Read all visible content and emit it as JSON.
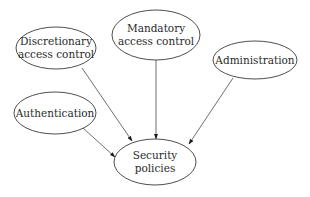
{
  "diagram": {
    "type": "directed-graph",
    "nodes": [
      {
        "id": "discretionary",
        "lines": [
          "Discretionary",
          "access control"
        ],
        "cx": 56,
        "cy": 48,
        "rx": 40,
        "ry": 21
      },
      {
        "id": "mandatory",
        "lines": [
          "Mandatory",
          "access control"
        ],
        "cx": 156,
        "cy": 35,
        "rx": 44,
        "ry": 25
      },
      {
        "id": "administration",
        "lines": [
          "Administration"
        ],
        "cx": 255,
        "cy": 60,
        "rx": 42,
        "ry": 19
      },
      {
        "id": "authentication",
        "lines": [
          "Authentication"
        ],
        "cx": 55,
        "cy": 113,
        "rx": 41,
        "ry": 21
      },
      {
        "id": "security-policies",
        "lines": [
          "Security",
          "policies"
        ],
        "cx": 155,
        "cy": 162,
        "rx": 41,
        "ry": 23
      }
    ],
    "edges": [
      {
        "from": "discretionary",
        "to": "security-policies",
        "x1": 82,
        "y1": 68,
        "x2": 132,
        "y2": 141
      },
      {
        "from": "mandatory",
        "to": "security-policies",
        "x1": 156,
        "y1": 60,
        "x2": 156,
        "y2": 139
      },
      {
        "from": "administration",
        "to": "security-policies",
        "x1": 233,
        "y1": 78,
        "x2": 189,
        "y2": 144
      },
      {
        "from": "authentication",
        "to": "security-policies",
        "x1": 83,
        "y1": 128,
        "x2": 115,
        "y2": 157
      }
    ],
    "colors": {
      "stroke": "#3a3a3a",
      "text": "#2a2a2a",
      "background": "#ffffff"
    }
  },
  "labels": {
    "discretionary_1": "Discretionary",
    "discretionary_2": "access control",
    "mandatory_1": "Mandatory",
    "mandatory_2": "access control",
    "administration": "Administration",
    "authentication": "Authentication",
    "security_1": "Security",
    "security_2": "policies"
  }
}
